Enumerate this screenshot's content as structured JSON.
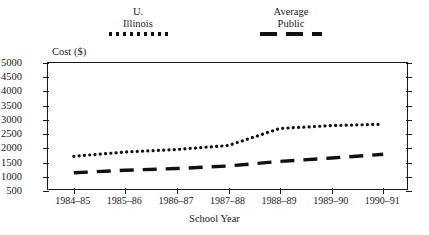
{
  "axis": {
    "y_title": "Cost ($)",
    "x_title": "School Year",
    "y_ticks": [
      "5000",
      "4500",
      "4000",
      "3500",
      "3000",
      "2500",
      "2000",
      "1500",
      "1000",
      "500"
    ],
    "x_ticks": [
      "1984–85",
      "1985–86",
      "1986–87",
      "1987–88",
      "1988–89",
      "1989–90",
      "1990–91"
    ]
  },
  "legend": {
    "items": [
      {
        "line1": "U.",
        "line2": "Illinois",
        "style": "dotted",
        "color": "#111111"
      },
      {
        "line1": "Average",
        "line2": "Public",
        "style": "dashed",
        "color": "#111111"
      }
    ]
  },
  "chart_data": {
    "type": "line",
    "title": "",
    "xlabel": "School Year",
    "ylabel": "Cost ($)",
    "categories": [
      "1984–85",
      "1985–86",
      "1986–87",
      "1987–88",
      "1988–89",
      "1989–90",
      "1990–91"
    ],
    "ylim": [
      500,
      5000
    ],
    "ytick_step": 500,
    "grid": false,
    "legend_position": "top",
    "series": [
      {
        "name": "U. Illinois",
        "style": "dotted",
        "color": "#111111",
        "values": [
          1720,
          1870,
          1960,
          2100,
          2700,
          2800,
          2850
        ]
      },
      {
        "name": "Average Public",
        "style": "dashed",
        "color": "#111111",
        "values": [
          1140,
          1230,
          1290,
          1380,
          1540,
          1660,
          1790
        ]
      }
    ]
  }
}
